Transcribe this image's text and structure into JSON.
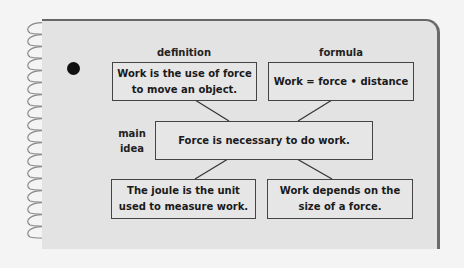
{
  "diagram": {
    "type": "concept-map",
    "labels": {
      "definition": "definition",
      "formula": "formula",
      "main_idea": "main\nidea"
    },
    "nodes": {
      "definition": "Work is the use of force to move an object.",
      "formula": "Work = force • distance",
      "main_idea": "Force is necessary to do work.",
      "detail_left": "The joule is the unit used to measure work.",
      "detail_right": "Work depends on the size of a force."
    },
    "edges": [
      {
        "from": "definition",
        "to": "main_idea"
      },
      {
        "from": "formula",
        "to": "main_idea"
      },
      {
        "from": "main_idea",
        "to": "detail_left"
      },
      {
        "from": "main_idea",
        "to": "detail_right"
      }
    ]
  },
  "colors": {
    "page": "#e3e3e3",
    "background": "#f4f4f4",
    "border": "#444444",
    "text": "#1a1a1a"
  }
}
